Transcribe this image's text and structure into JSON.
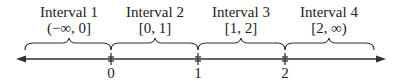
{
  "intervals": [
    {
      "title": "Interval 1",
      "range": "(−∞, 0]"
    },
    {
      "title": "Interval 2",
      "range": "[0, 1]"
    },
    {
      "title": "Interval 3",
      "range": "[1, 2]"
    },
    {
      "title": "Interval 4",
      "range": "[2, ∞)"
    }
  ],
  "ticks": [
    "0",
    "1",
    "2"
  ]
}
